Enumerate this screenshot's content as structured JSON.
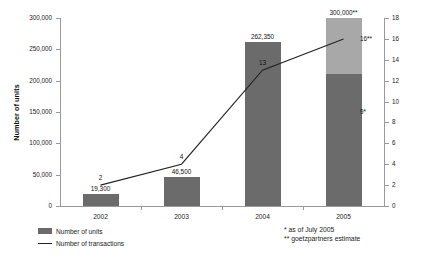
{
  "chart_data": {
    "type": "bar",
    "title": "",
    "categories": [
      "2002",
      "2003",
      "2004",
      "2005"
    ],
    "xlabel": "",
    "ylabel": "Number of units",
    "y2label": "Number of transactions",
    "ylim": [
      0,
      300000
    ],
    "y2lim": [
      0,
      18
    ],
    "grid": false,
    "legend_position": "bottom-left",
    "y_ticks": [
      "0",
      "50,000",
      "100,000",
      "150,000",
      "200,000",
      "250,000",
      "300,000"
    ],
    "y_tick_values": [
      0,
      50000,
      100000,
      150000,
      200000,
      250000,
      300000
    ],
    "y2_ticks": [
      "0",
      "2",
      "4",
      "6",
      "8",
      "10",
      "12",
      "14",
      "16",
      "18"
    ],
    "y2_tick_values": [
      0,
      2,
      4,
      6,
      8,
      10,
      12,
      14,
      16,
      18
    ],
    "series": [
      {
        "name": "Number of units",
        "type": "bar",
        "axis": "left",
        "values": [
          19300,
          46500,
          262350,
          300000
        ],
        "labels": [
          "19,300",
          "46,500",
          "262,350",
          "300,000**"
        ],
        "stacked_2005": {
          "actual_value": 210000,
          "actual_label": "210,000*",
          "estimate_value": 300000,
          "estimate_label": "300,000**"
        }
      },
      {
        "name": "Number of transactions",
        "type": "line",
        "axis": "right",
        "values": [
          2,
          4,
          13,
          16
        ],
        "labels": [
          "2",
          "4",
          "13",
          "16**"
        ],
        "actual_2005_value": 9,
        "actual_2005_label": "9*"
      }
    ]
  },
  "axes": {
    "left_title": "Number of units",
    "right_title": "Number of transactions"
  },
  "legend": {
    "items": [
      {
        "label": "Number of units",
        "marker": "swatch"
      },
      {
        "label": "Number of transactions",
        "marker": "line"
      }
    ]
  },
  "footnotes": [
    "*  as of July 2005",
    "** goetzpartners estimate"
  ],
  "colors": {
    "bar_actual": "#6b6b6b",
    "bar_estimate": "#a8a8a8",
    "line": "#222222",
    "axis": "#9a9a9a",
    "text": "#1a1a1a",
    "background": "#ffffff"
  }
}
